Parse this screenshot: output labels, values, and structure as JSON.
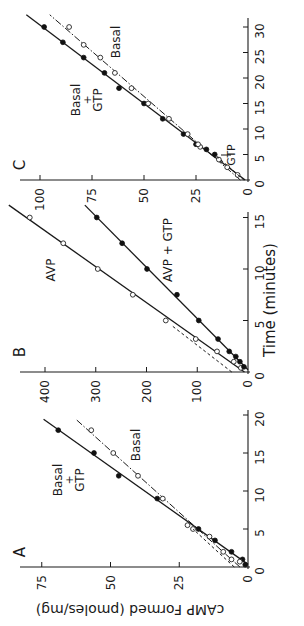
{
  "figure": {
    "shared_xlabel": "Time (minutes)",
    "shared_ylabel": "cAMP Formed (pmoles/mg)",
    "rotation_deg": -90
  },
  "chart_data": [
    {
      "panel": "A",
      "type": "line",
      "xlabel": "Time (minutes)",
      "ylabel": "cAMP Formed (pmoles/mg)",
      "xlim": [
        0,
        20
      ],
      "ylim": [
        0,
        80
      ],
      "xticks": [
        0,
        5,
        10,
        15,
        20
      ],
      "yticks": [
        0,
        25,
        50,
        75
      ],
      "grid": false,
      "annotations": [
        {
          "text": "Basal",
          "sub": "+",
          "sub2": "GTP",
          "target": "Basal + GTP"
        },
        {
          "text": "Basal",
          "target": "Basal"
        }
      ],
      "series": [
        {
          "name": "Basal + GTP",
          "marker": "filled-circle",
          "line": "solid",
          "x": [
            0.3,
            1,
            2,
            3.5,
            5,
            9,
            12,
            15,
            18
          ],
          "y": [
            1,
            2,
            6,
            12,
            18,
            33,
            47,
            56,
            69
          ]
        },
        {
          "name": "Basal",
          "marker": "open-circle",
          "line": "dash-dot",
          "x": [
            0.7,
            1,
            2,
            4,
            5,
            5.5,
            9,
            12,
            15,
            18
          ],
          "y": [
            3,
            6,
            9,
            14,
            20,
            22,
            31,
            40,
            49,
            57
          ]
        },
        {
          "name": "Initial-rate extrapolation",
          "marker": "none",
          "line": "dashed",
          "x": [
            0,
            5
          ],
          "y": [
            5,
            20
          ]
        }
      ]
    },
    {
      "panel": "B",
      "type": "line",
      "xlabel": "Time (minutes)",
      "ylabel": "cAMP Formed (pmoles/mg)",
      "xlim": [
        0,
        15
      ],
      "ylim": [
        0,
        440
      ],
      "xticks": [
        0,
        5,
        10,
        15
      ],
      "yticks": [
        0,
        100,
        200,
        300,
        400
      ],
      "grid": false,
      "annotations": [
        {
          "text": "AVP",
          "target": "AVP"
        },
        {
          "text": "AVP + GTP",
          "target": "AVP + GTP"
        }
      ],
      "series": [
        {
          "name": "AVP",
          "marker": "open-circle",
          "line": "solid",
          "x": [
            0.4,
            1,
            2,
            3.2,
            5,
            7.5,
            10,
            12.5,
            15
          ],
          "y": [
            14,
            28,
            61,
            103,
            162,
            227,
            296,
            364,
            430
          ]
        },
        {
          "name": "AVP + GTP",
          "marker": "filled-circle",
          "line": "solid",
          "x": [
            0.5,
            1,
            1.5,
            2,
            3.2,
            5,
            7.5,
            10,
            12.5,
            15
          ],
          "y": [
            8,
            16,
            24,
            37,
            59,
            97,
            140,
            199,
            248,
            298
          ]
        },
        {
          "name": "Initial-rate extrapolation",
          "marker": "none",
          "line": "dashed",
          "x": [
            0,
            4.5
          ],
          "y": [
            32,
            150
          ]
        }
      ]
    },
    {
      "panel": "C",
      "type": "line",
      "xlabel": "Time (minutes)",
      "ylabel": "cAMP Formed (pmoles/mg)",
      "xlim": [
        0,
        30
      ],
      "ylim": [
        0,
        100
      ],
      "xticks": [
        0,
        5,
        10,
        15,
        20,
        25,
        30
      ],
      "yticks": [
        0,
        25,
        50,
        75,
        100
      ],
      "grid": false,
      "annotations": [
        {
          "text": "Basal",
          "sub": "+",
          "sub2": "GTP",
          "target": "Basal + GTP"
        },
        {
          "text": "Basal",
          "target": "Basal"
        },
        {
          "text": "GTP",
          "arrow": true,
          "at_time": 5,
          "note": "GTP addition"
        }
      ],
      "series": [
        {
          "name": "Basal + GTP",
          "marker": "filled-circle",
          "line": "solid",
          "x": [
            5,
            6,
            7,
            9,
            12,
            15,
            18,
            21,
            24,
            27,
            30
          ],
          "y": [
            16,
            20,
            25,
            31,
            41,
            50,
            62,
            69,
            79,
            89,
            98
          ]
        },
        {
          "name": "Basal",
          "marker": "open-circle",
          "line": "dash-dot",
          "x": [
            1,
            2.5,
            4,
            6.5,
            7,
            9,
            12,
            15,
            18,
            21,
            24,
            26.5,
            30
          ],
          "y": [
            5,
            10,
            14,
            23,
            24,
            29,
            38,
            48,
            56,
            64,
            71,
            79,
            86
          ]
        },
        {
          "name": "Initial-rate extrapolation",
          "marker": "none",
          "line": "dashed",
          "x": [
            0,
            5
          ],
          "y": [
            2,
            16
          ]
        }
      ]
    }
  ],
  "layout": {
    "panels": {
      "A": {
        "x0": 248,
        "y0": 567,
        "px_per_x": 7.6,
        "px_per_y": 2.75,
        "axis_left": 20,
        "axis_top": 410,
        "letter_pos": [
          25,
          552
        ]
      },
      "B": {
        "x0": 248,
        "y0": 372,
        "px_per_x": 10.3,
        "px_per_y": 0.5075,
        "axis_left": 20,
        "axis_top": 212,
        "letter_pos": [
          25,
          352
        ]
      },
      "C": {
        "x0": 248,
        "y0": 180,
        "px_per_x": 5.1,
        "px_per_y": 2.08,
        "axis_left": 20,
        "axis_top": 18,
        "letter_pos": [
          25,
          165
        ]
      }
    },
    "labels": {
      "A": [
        {
          "target": "Basal + GTP",
          "x": 62,
          "y": 480
        },
        {
          "target": "Basal",
          "x": 140,
          "y": 445
        }
      ],
      "B": [
        {
          "target": "AVP",
          "x": 55,
          "y": 270
        },
        {
          "target": "AVP + GTP",
          "x": 172,
          "y": 250
        }
      ],
      "C": [
        {
          "target": "Basal + GTP",
          "x": 80,
          "y": 100
        },
        {
          "target": "Basal",
          "x": 120,
          "y": 42
        },
        {
          "target": "GTP",
          "x": 235,
          "y": 155
        }
      ]
    },
    "xlabel_pos": [
      275,
      300
    ],
    "ylabel_pos": [
      130,
      605
    ]
  }
}
